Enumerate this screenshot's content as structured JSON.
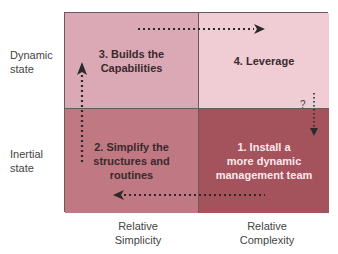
{
  "y_axis": {
    "top_label": [
      "Dynamic",
      "state"
    ],
    "bottom_label": [
      "Inertial",
      "state"
    ]
  },
  "x_axis": {
    "left_label": [
      "Relative",
      "Simplicity"
    ],
    "right_label": [
      "Relative",
      "Complexity"
    ]
  },
  "quadrants": {
    "q1": {
      "lines": [
        "1. Install a",
        "more dynamic",
        "management team"
      ],
      "color": "#a4525c"
    },
    "q2": {
      "lines": [
        "2. Simplify the",
        "structures and",
        "routines"
      ],
      "color": "#c07882"
    },
    "q3": {
      "lines": [
        "3. Builds the",
        "Capabilities"
      ],
      "color": "#dba9b6"
    },
    "q4": {
      "lines": [
        "4. Leverage"
      ],
      "color": "#f0ccd4"
    }
  },
  "annotations": {
    "question_mark": "?"
  }
}
